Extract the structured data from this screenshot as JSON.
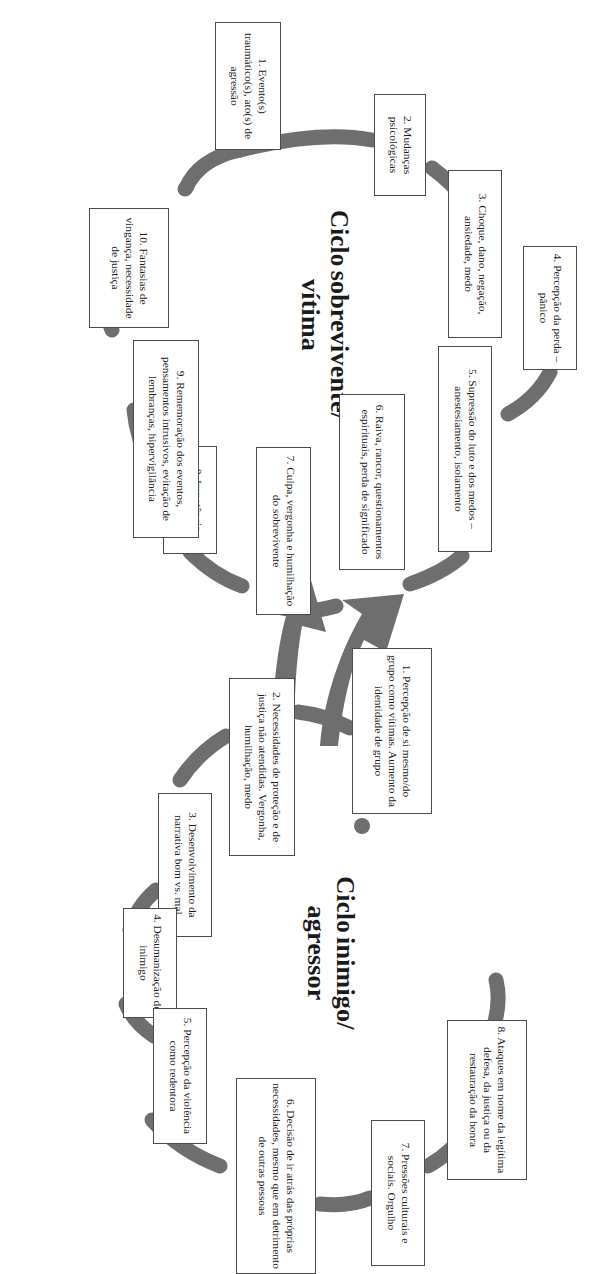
{
  "diagram": {
    "type": "two-cycle-diagram",
    "orientation": "rotated-90-clockwise",
    "colors": {
      "ring": "#6e6e6e",
      "box_border": "#4a4a4a",
      "box_fill": "#ffffff",
      "text": "#1a1a1a",
      "background": "#ffffff"
    }
  },
  "cycles": [
    {
      "id": "survivor-victim",
      "title_line1": "Ciclo",
      "title_line2": "sobrevivente/",
      "title_line3": "vítima",
      "steps": [
        {
          "n": "1",
          "text": "1. Evento(s) traumático(s), ato(s) de agressão"
        },
        {
          "n": "2",
          "text": "2. Mudanças psicológicas"
        },
        {
          "n": "3",
          "text": "3. Choque, dano, negação, ansiedade, medo"
        },
        {
          "n": "4",
          "text": "4. Percepção da perda – pânico"
        },
        {
          "n": "5",
          "text": "5. Supressão do luto e dos medos – anestesiamento, isolamento"
        },
        {
          "n": "6",
          "text": "6. Raiva, rancor, questionamentos espirituais, perda de significado"
        },
        {
          "n": "7",
          "text": "7. Culpa, vergonha e humilhação do sobrevivente"
        },
        {
          "n": "8",
          "text": "8. Impotência (aprendida)"
        },
        {
          "n": "9",
          "text": "9. Rememoração dos eventos, pensamentos intrusivos, evitação de lembranças, hipervigilância"
        },
        {
          "n": "10",
          "text": "10. Fantasias de vingança, necessidade de justiça"
        }
      ]
    },
    {
      "id": "enemy-aggressor",
      "title_line1": "Ciclo",
      "title_line2": "inimigo/",
      "title_line3": "agressor",
      "steps": [
        {
          "n": "1",
          "text": "1. Percepção de si mesmo/do grupo como vítimas. Aumento da identidade de grupo"
        },
        {
          "n": "2",
          "text": "2. Necessidades de proteção e de justiça não atendidas. Vergonha, humilhação, medo"
        },
        {
          "n": "3",
          "text": "3. Desenvolvimento da narrativa bom vs. mal"
        },
        {
          "n": "4",
          "text": "4. Desumanização do inimigo"
        },
        {
          "n": "5",
          "text": "5. Percepção da violência como redentora"
        },
        {
          "n": "6",
          "text": "6. Decisão de ir atrás das próprias necessidades, mesmo que em detrimento de outras pessoas"
        },
        {
          "n": "7",
          "text": "7. Pressões culturais e sociais. Orgulho"
        },
        {
          "n": "8",
          "text": "8. Ataques em nome da legítima defesa, da justiça ou da restauração da honra"
        }
      ]
    }
  ],
  "connectors": {
    "between_cycles": "double-arrow-crossing",
    "arrow_count": 2
  }
}
